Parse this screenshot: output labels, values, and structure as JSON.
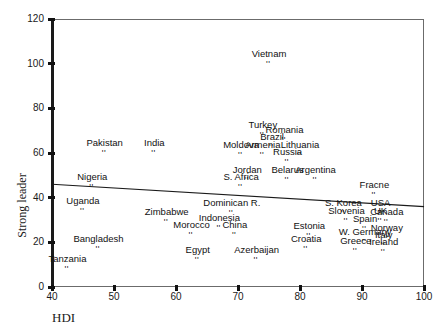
{
  "chart_data": {
    "type": "scatter",
    "title": "",
    "xlabel": "HDI",
    "ylabel": "Strong leader",
    "xlim": [
      40,
      100
    ],
    "ylim": [
      0,
      120
    ],
    "xticks": [
      40,
      50,
      60,
      70,
      80,
      90,
      100
    ],
    "yticks": [
      0,
      20,
      40,
      60,
      80,
      100,
      120
    ],
    "grid": false,
    "legend": "none",
    "marker_glyph": "''",
    "trendline": {
      "label": "linear fit",
      "x": [
        40,
        100
      ],
      "y": [
        46,
        36
      ]
    },
    "points": [
      {
        "label": "Vietnam",
        "x": 75.0,
        "y": 100.0
      },
      {
        "label": "Turkey",
        "x": 74.0,
        "y": 68.0
      },
      {
        "label": "Romania",
        "x": 77.5,
        "y": 66.0
      },
      {
        "label": "Brazil",
        "x": 75.5,
        "y": 62.5
      },
      {
        "label": "Pakistan",
        "x": 48.5,
        "y": 60.0
      },
      {
        "label": "India",
        "x": 56.5,
        "y": 60.0
      },
      {
        "label": "Moldova",
        "x": 70.5,
        "y": 59.0
      },
      {
        "label": "Armenia",
        "x": 74.0,
        "y": 59.0
      },
      {
        "label": "Lithuania",
        "x": 80.0,
        "y": 59.0
      },
      {
        "label": "Russia",
        "x": 78.0,
        "y": 56.0
      },
      {
        "label": "Jordan",
        "x": 71.5,
        "y": 48.0
      },
      {
        "label": "Belarus",
        "x": 78.0,
        "y": 48.0
      },
      {
        "label": "Argentina",
        "x": 82.5,
        "y": 48.0
      },
      {
        "label": "Nigeria",
        "x": 46.5,
        "y": 45.0
      },
      {
        "label": "S. Africa",
        "x": 70.5,
        "y": 45.0
      },
      {
        "label": "Fracne",
        "x": 92.0,
        "y": 41.0
      },
      {
        "label": "Uganda",
        "x": 45.0,
        "y": 34.0
      },
      {
        "label": "Dominican R.",
        "x": 69.0,
        "y": 33.0
      },
      {
        "label": "S. Korea",
        "x": 87.0,
        "y": 33.0
      },
      {
        "label": "USA",
        "x": 93.0,
        "y": 33.0
      },
      {
        "label": "Slovenia",
        "x": 87.5,
        "y": 29.5
      },
      {
        "label": "UK",
        "x": 93.0,
        "y": 29.5
      },
      {
        "label": "Canada",
        "x": 94.0,
        "y": 29.0
      },
      {
        "label": "Zimbabwe",
        "x": 58.5,
        "y": 29.0
      },
      {
        "label": "Indonesia",
        "x": 67.0,
        "y": 26.5
      },
      {
        "label": "Spain",
        "x": 90.5,
        "y": 26.0
      },
      {
        "label": "Morocco",
        "x": 62.5,
        "y": 23.5
      },
      {
        "label": "China",
        "x": 69.5,
        "y": 23.5
      },
      {
        "label": "Estonia",
        "x": 81.5,
        "y": 23.0
      },
      {
        "label": "Norway",
        "x": 94.0,
        "y": 22.0
      },
      {
        "label": "W. Germany",
        "x": 90.5,
        "y": 20.0
      },
      {
        "label": "Italy",
        "x": 93.5,
        "y": 19.0
      },
      {
        "label": "Bangladesh",
        "x": 47.5,
        "y": 17.0
      },
      {
        "label": "Croatia",
        "x": 81.0,
        "y": 17.0
      },
      {
        "label": "Greece",
        "x": 89.0,
        "y": 16.0
      },
      {
        "label": "Ireland",
        "x": 93.5,
        "y": 15.5
      },
      {
        "label": "Egypt",
        "x": 63.5,
        "y": 12.0
      },
      {
        "label": "Azerbaijan",
        "x": 73.0,
        "y": 12.0
      },
      {
        "label": "Tanzania",
        "x": 42.5,
        "y": 8.0
      }
    ]
  },
  "axes": {
    "x_title": "HDI",
    "y_title": "Strong leader",
    "x_tick_labels": [
      "40",
      "50",
      "60",
      "70",
      "80",
      "90",
      "100"
    ],
    "y_tick_labels": [
      "0",
      "20",
      "40",
      "60",
      "80",
      "100",
      "120"
    ]
  },
  "colors": {
    "axis": "#1a1a1a",
    "frame": "#6b6b6b",
    "text": "#111111",
    "trendline": "#1a1a1a",
    "background": "#ffffff"
  }
}
